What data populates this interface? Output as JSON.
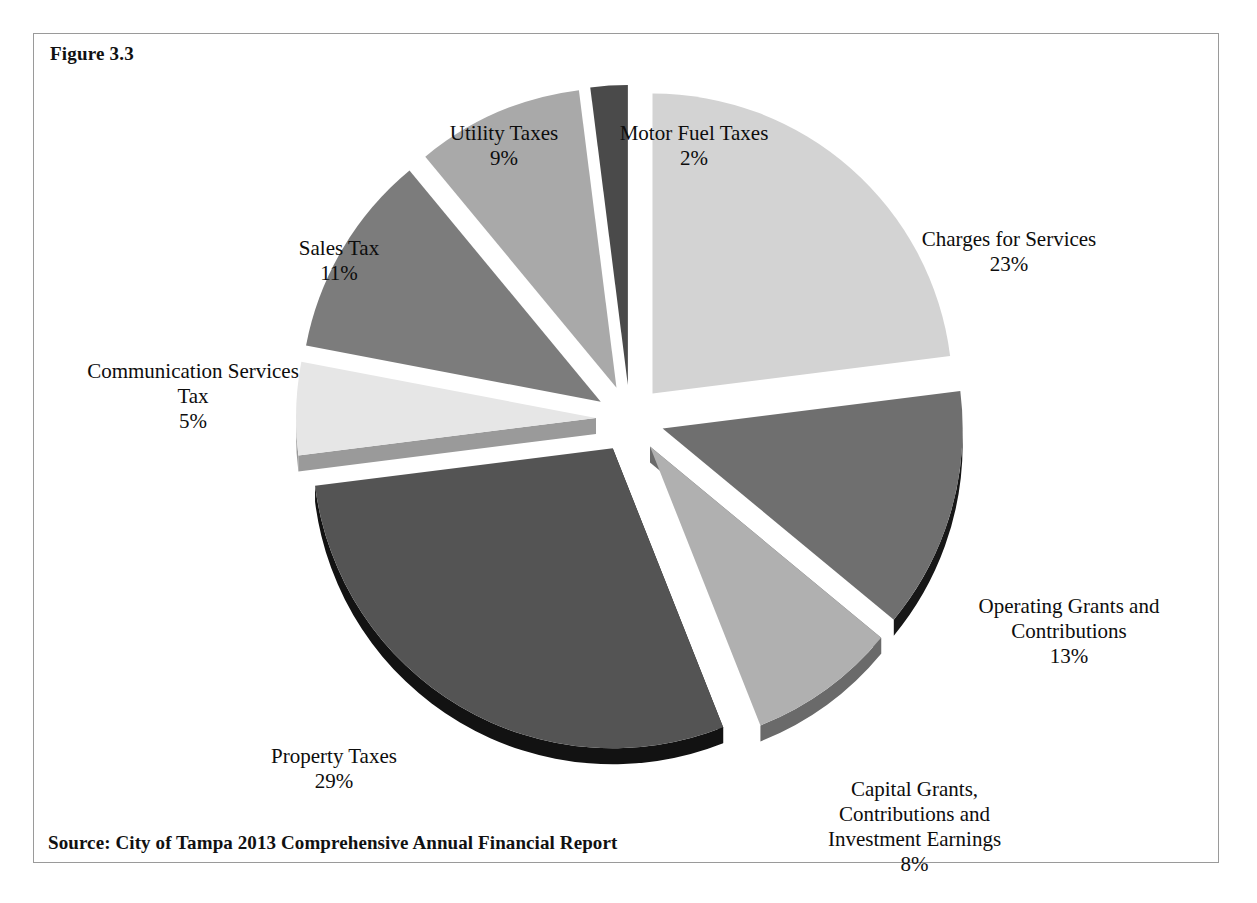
{
  "figure": {
    "caption": "Figure 3.3",
    "source": "Source: City of Tampa 2013 Comprehensive Annual Financial Report"
  },
  "chart_data": {
    "type": "pie",
    "title": "Figure 3.3",
    "subtitle": "",
    "xlabel": "",
    "ylabel": "",
    "exploded": true,
    "three_d": true,
    "legend_position": "none",
    "labels_outside": true,
    "categories": [
      "Charges for Services",
      "Operating Grants and Contributions",
      "Capital Grants, Contributions and Investment Earnings",
      "Property Taxes",
      "Communication Services Tax",
      "Sales Tax",
      "Utility Taxes",
      "Motor Fuel Taxes"
    ],
    "values": [
      23,
      13,
      8,
      29,
      5,
      11,
      9,
      2
    ],
    "value_labels": [
      "23%",
      "13%",
      "8%",
      "29%",
      "5%",
      "11%",
      "9%",
      "2%"
    ],
    "units": "percent",
    "total": 100,
    "colors": [
      "#d3d3d3",
      "#6f6f6f",
      "#b0b0b0",
      "#545454",
      "#e6e6e6",
      "#7c7c7c",
      "#a9a9a9",
      "#4a4a4a"
    ],
    "edge_colors": [
      "#8e8e8e",
      "#171717",
      "#6a6a6a",
      "#121212",
      "#9a9a9a",
      "#2a2a2a",
      "#4a4a4a",
      "#2a2a2a"
    ]
  },
  "slices": [
    {
      "name": "charges-for-services",
      "label": "Charges for Services",
      "percent": "23%",
      "color": "#d3d3d3",
      "edge": "#8e8e8e"
    },
    {
      "name": "operating-grants-and-contributions",
      "label": "Operating Grants and\nContributions",
      "percent": "13%",
      "color": "#6f6f6f",
      "edge": "#171717"
    },
    {
      "name": "capital-grants-contributions-and-investment-earnings",
      "label": "Capital Grants,\nContributions and\nInvestment Earnings",
      "percent": "8%",
      "color": "#b0b0b0",
      "edge": "#6a6a6a"
    },
    {
      "name": "property-taxes",
      "label": "Property Taxes",
      "percent": "29%",
      "color": "#545454",
      "edge": "#121212"
    },
    {
      "name": "communication-services-tax",
      "label": "Communication Services\nTax",
      "percent": "5%",
      "color": "#e6e6e6",
      "edge": "#9a9a9a"
    },
    {
      "name": "sales-tax",
      "label": "Sales Tax",
      "percent": "11%",
      "color": "#7c7c7c",
      "edge": "#2a2a2a"
    },
    {
      "name": "utility-taxes",
      "label": "Utility Taxes",
      "percent": "9%",
      "color": "#a9a9a9",
      "edge": "#4a4a4a"
    },
    {
      "name": "motor-fuel-taxes",
      "label": "Motor Fuel Taxes",
      "percent": "2%",
      "color": "#4a4a4a",
      "edge": "#2a2a2a"
    }
  ]
}
